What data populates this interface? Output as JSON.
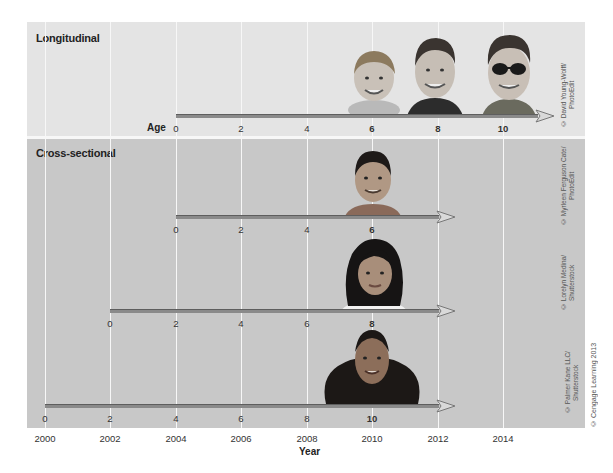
{
  "panels": {
    "longitudinal": {
      "title": "Longitudinal",
      "axis_label": "Age",
      "age_ticks": [
        "0",
        "2",
        "4",
        "6",
        "8",
        "10"
      ],
      "highlight_ticks": [
        "6",
        "8",
        "10"
      ],
      "photos": [
        "boy-age-6",
        "boy-age-8",
        "boy-age-10-sunglasses"
      ],
      "credit": "© David Young-Wolff/ PhotoEdit"
    },
    "cross_sectional": {
      "title": "Cross-sectional",
      "rows": [
        {
          "age_ticks": [
            "0",
            "2",
            "4",
            "6"
          ],
          "highlight": "6",
          "start_year": 2004,
          "photo": "boy-age-6",
          "credit": "© Myrleen Ferguson Cate/ PhotoEdit"
        },
        {
          "age_ticks": [
            "0",
            "2",
            "4",
            "6",
            "8"
          ],
          "highlight": "8",
          "start_year": 2002,
          "photo": "girl-age-8",
          "credit": "© Lorelyn Medina/ Shutterstock"
        },
        {
          "age_ticks": [
            "0",
            "2",
            "4",
            "6",
            "8",
            "10"
          ],
          "highlight": "10",
          "start_year": 2000,
          "photo": "girl-age-10",
          "credit": "© Palmer Kane LLC/ Shutterstock"
        }
      ]
    }
  },
  "x_axis": {
    "title": "Year",
    "ticks": [
      "2000",
      "2002",
      "2004",
      "2006",
      "2008",
      "2010",
      "2012",
      "2014"
    ]
  },
  "copyright": "© Cengage Learning 2013",
  "colors": {
    "longitudinal_bg": "#e4e4e4",
    "cross_sectional_bg": "#c8c8c8",
    "gridline": "#f7f7f7",
    "arrow": "#8a8a8a"
  }
}
